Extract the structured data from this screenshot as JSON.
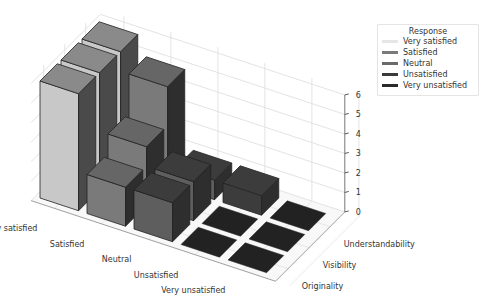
{
  "chart_data": {
    "type": "bar3d",
    "title": "",
    "x_categories": [
      "Very satisfied",
      "Satisfied",
      "Neutral",
      "Unsatisfied",
      "Very unsatisfied"
    ],
    "y_categories": [
      "Originality",
      "Visibility",
      "Understandability"
    ],
    "z_ticks": [
      0,
      1,
      2,
      3,
      4,
      5,
      6
    ],
    "zlim": [
      0,
      6
    ],
    "grid": true,
    "legend_position": "upper right (outside)",
    "legend": {
      "title": "Response",
      "entries": [
        {
          "label": "Very satisfied",
          "color": "#e6e6e6"
        },
        {
          "label": "Satisfied",
          "color": "#7a7a7a"
        },
        {
          "label": "Neutral",
          "color": "#6a6a6a"
        },
        {
          "label": "Unsatisfied",
          "color": "#3a3a3a"
        },
        {
          "label": "Very unsatisfied",
          "color": "#2a2a2a"
        }
      ]
    },
    "series": [
      {
        "name": "Originality",
        "values": [
          6,
          2,
          2,
          0,
          0
        ]
      },
      {
        "name": "Visibility",
        "values": [
          6,
          3,
          2,
          0,
          0
        ]
      },
      {
        "name": "Understandability",
        "values": [
          6,
          5,
          1,
          1,
          0
        ]
      }
    ],
    "bar_colors": [
      "#c8c8c8",
      "#7a7a7a",
      "#5e5e5e",
      "#3c3c3c",
      "#2a2a2a"
    ]
  }
}
